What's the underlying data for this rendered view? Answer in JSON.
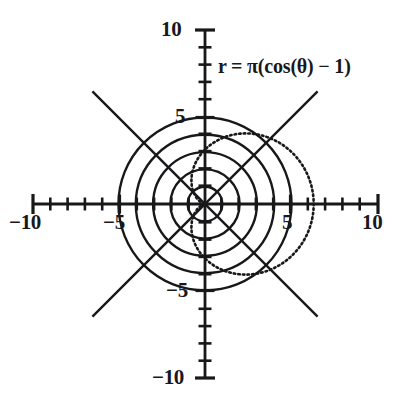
{
  "figure": {
    "kind": "polar-plot",
    "equation_label": "r = π(cos(θ) − 1)",
    "background_color": "#ffffff",
    "ink_color": "#18181a"
  },
  "axes": {
    "x_labels": [
      "−10",
      "−5",
      "5",
      "10"
    ],
    "y_labels": [
      "10",
      "5",
      "−5",
      "−10"
    ],
    "origin_px": [
      205,
      204
    ],
    "px_per_unit": 17.3
  },
  "chart_data": {
    "type": "line",
    "title": "",
    "subtitle": "",
    "xlabel": "",
    "ylabel": "",
    "xlim": [
      -10,
      10
    ],
    "ylim": [
      -10,
      10
    ],
    "grid": "polar",
    "legend_position": "inside-top-right",
    "annotations": [
      {
        "text": "r = π(cos(θ) − 1)",
        "x": 1.0,
        "y": 8.5
      }
    ],
    "axis_ticks": {
      "x_major": [
        -10,
        -5,
        5,
        10
      ],
      "x_minor_step": 1,
      "y_major": [
        -10,
        -5,
        5,
        10
      ],
      "y_minor_step": 1
    },
    "polar_grid": {
      "circle_radii": [
        1,
        2,
        3,
        4,
        5
      ],
      "ray_angles_deg": [
        45,
        135,
        225,
        315
      ],
      "ray_length": 9.2
    },
    "series": [
      {
        "name": "r = π(cos(θ) − 1)",
        "style": "dotted",
        "polar": true,
        "equation": "r = pi*(cos(theta) - 1)",
        "r_max_abs": 6.283,
        "theta_range_deg": [
          0,
          360
        ],
        "description": "cardioid opening to the right, cusp at origin, extreme point at (6.283, 0)",
        "points": [
          [
            0.0,
            0.0
          ],
          [
            0.094,
            -0.011
          ],
          [
            0.374,
            -0.089
          ],
          [
            0.836,
            -0.298
          ],
          [
            1.468,
            -0.699
          ],
          [
            2.249,
            -1.348
          ],
          [
            3.151,
            -2.289
          ],
          [
            4.135,
            -3.546
          ],
          [
            5.156,
            -5.116
          ],
          [
            6.161,
            -6.963
          ],
          [
            7.095,
            -9.013
          ],
          [
            7.903,
            -11.156
          ],
          [
            8.532,
            -13.245
          ],
          [
            8.937,
            -15.101
          ],
          [
            9.085,
            -16.521
          ],
          [
            8.956,
            -17.291
          ],
          [
            8.547,
            -17.2
          ],
          [
            7.874,
            -16.07
          ],
          [
            6.974,
            -13.784
          ],
          [
            5.906,
            -10.318
          ],
          [
            4.749,
            -5.767
          ],
          [
            3.601,
            -0.361
          ],
          [
            2.574,
            5.44
          ],
          [
            1.783,
            11.086
          ],
          [
            1.327,
            15.996
          ],
          [
            1.273,
            19.624
          ],
          [
            1.642,
            21.521
          ],
          [
            2.4,
            21.386
          ],
          [
            3.459,
            19.107
          ],
          [
            4.688,
            14.78
          ],
          [
            5.93,
            8.702
          ],
          [
            7.027,
            1.356
          ],
          [
            7.843,
            -6.62
          ],
          [
            8.283,
            -14.44
          ],
          [
            8.308,
            -21.3
          ],
          [
            7.937,
            -26.468
          ],
          [
            7.243,
            -29.36
          ],
          [
            6.337,
            -29.6
          ],
          [
            5.35,
            -27.05
          ],
          [
            4.408,
            -21.83
          ],
          [
            3.608,
            -14.3
          ],
          [
            3.0,
            -5.0
          ],
          [
            2.6,
            5.3
          ],
          [
            2.4,
            15.7
          ],
          [
            2.36,
            25.3
          ],
          [
            2.4,
            33.4
          ],
          [
            2.45,
            39.4
          ],
          [
            2.43,
            42.9
          ],
          [
            2.3,
            43.7
          ],
          [
            2.06,
            41.7
          ],
          [
            1.7,
            37.2
          ],
          [
            1.3,
            30.5
          ],
          [
            0.9,
            22.4
          ],
          [
            0.55,
            13.7
          ],
          [
            0.28,
            5.4
          ],
          [
            0.1,
            -1.5
          ],
          [
            0.0,
            0.0
          ]
        ]
      }
    ]
  }
}
